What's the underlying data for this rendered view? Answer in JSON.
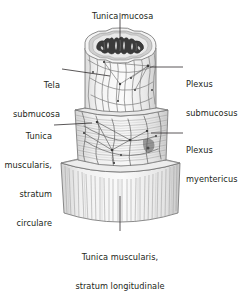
{
  "figure": {
    "background_color": "#ffffff",
    "text_color": "#231f20",
    "leader_line_color": "#231f20",
    "outline_color": "#58595b",
    "fiber_color": "#8c8c8c",
    "mucosa_dark_color": "#3b3b3b",
    "mucosa_mid_color": "#9a9a9a",
    "mucosa_light_color": "#d8d8d8",
    "layer_fill_light": "#f2f2f2",
    "layer_fill_mid": "#e6e6e6"
  },
  "labels": {
    "tunica_mucosa": {
      "text": "Tunica mucosa",
      "lines": [
        "Tunica mucosa"
      ],
      "position": "top-center"
    },
    "tela_submucosa": {
      "text": "Tela submucosa",
      "lines": [
        "Tela",
        "submucosa"
      ],
      "position": "left-upper"
    },
    "tunica_muscularis_circulare": {
      "text": "Tunica muscularis, stratum circulare",
      "lines": [
        "Tunica",
        "muscularis,",
        "stratum",
        "circulare"
      ],
      "position": "left-lower"
    },
    "plexus_submucosus": {
      "text": "Plexus submucosus",
      "lines": [
        "Plexus",
        "submucosus"
      ],
      "position": "right-upper"
    },
    "plexus_myentericus": {
      "text": "Plexus myentericus",
      "lines": [
        "Plexus",
        "myentericus"
      ],
      "position": "right-lower"
    },
    "tunica_muscularis_longitudinale": {
      "text": "Tunica muscularis, stratum longitudinale",
      "lines": [
        "Tunica muscularis,",
        "stratum longitudinale"
      ],
      "position": "bottom-center"
    }
  },
  "structures": {
    "mucosa_lumen": "folded dark mucosal lumen",
    "submucosa_cylinder": "tela submucosa with submucosal plexus network",
    "circular_muscle_cylinder": "stratum circulare with myenteric plexus",
    "longitudinal_muscle_cylinder": "stratum longitudinale vertical fibers"
  }
}
